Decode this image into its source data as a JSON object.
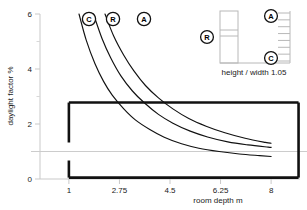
{
  "chart_data": {
    "type": "line",
    "title": "",
    "xlabel": "room depth m",
    "ylabel": "daylight factor %",
    "xlim": [
      0.0,
      9.0
    ],
    "ylim": [
      0,
      6
    ],
    "xticks": [
      "1",
      "2.75",
      "4.5",
      "6.25",
      "8"
    ],
    "xtick_values": [
      1,
      2.75,
      4.5,
      6.25,
      8
    ],
    "yticks": [
      "0",
      "2",
      "4",
      "6"
    ],
    "ytick_values": [
      0,
      2,
      4,
      6
    ],
    "grid": false,
    "reference_line": {
      "axis": "y",
      "value": 1,
      "color": "#cccccc",
      "label": ""
    },
    "legend_position": "inline-curve-labels",
    "series": [
      {
        "name": "C",
        "label": "C",
        "color": "#111111",
        "x": [
          1.35,
          1.6,
          1.9,
          2.2,
          2.5,
          2.9,
          3.3,
          3.8,
          4.3,
          4.9,
          5.5,
          6.2,
          6.9,
          7.6,
          8.0
        ],
        "y": [
          6.0,
          5.05,
          4.2,
          3.55,
          3.05,
          2.55,
          2.15,
          1.8,
          1.52,
          1.28,
          1.12,
          1.0,
          0.91,
          0.85,
          0.82
        ]
      },
      {
        "name": "R",
        "label": "R",
        "color": "#111111",
        "x": [
          1.85,
          2.15,
          2.45,
          2.8,
          3.2,
          3.6,
          4.1,
          4.6,
          5.2,
          5.8,
          6.5,
          7.2,
          7.9,
          8.0
        ],
        "y": [
          6.0,
          5.1,
          4.4,
          3.75,
          3.2,
          2.78,
          2.35,
          2.03,
          1.74,
          1.53,
          1.35,
          1.24,
          1.16,
          1.15
        ]
      },
      {
        "name": "A",
        "label": "A",
        "color": "#111111",
        "x": [
          2.25,
          2.55,
          2.9,
          3.25,
          3.65,
          4.1,
          4.6,
          5.15,
          5.75,
          6.4,
          7.1,
          7.8,
          8.0
        ],
        "y": [
          6.0,
          5.2,
          4.5,
          3.93,
          3.4,
          2.95,
          2.55,
          2.2,
          1.92,
          1.68,
          1.48,
          1.33,
          1.3
        ]
      }
    ],
    "annotations": [
      {
        "name": "C",
        "text": "C",
        "x_px": 89,
        "y_px": 19
      },
      {
        "name": "R",
        "text": "R",
        "x_px": 113,
        "y_px": 19
      },
      {
        "name": "A",
        "text": "A",
        "x_px": 144,
        "y_px": 19
      }
    ],
    "highlight_box": {
      "name": "room-outline-box",
      "description": "thick black rectangle with gap on left edge at reference line",
      "color": "#111111",
      "x0": 1.0,
      "x1": 8.95,
      "y0": 0.05,
      "y1": 2.78
    }
  },
  "axes": {
    "y_label": "daylight factor %",
    "x_label": "room depth m",
    "y_ticks": [
      "6",
      "4",
      "2",
      "0"
    ],
    "x_ticks": [
      "1",
      "2.75",
      "4.5",
      "6.25",
      "8"
    ]
  },
  "curve_labels": {
    "c": "C",
    "r": "R",
    "a": "A"
  },
  "inset": {
    "name": "section-diagram",
    "caption": "height / width 1.05",
    "marker_r": "R",
    "marker_a": "A",
    "marker_c": "C",
    "line_color": "#b8b8b8"
  }
}
